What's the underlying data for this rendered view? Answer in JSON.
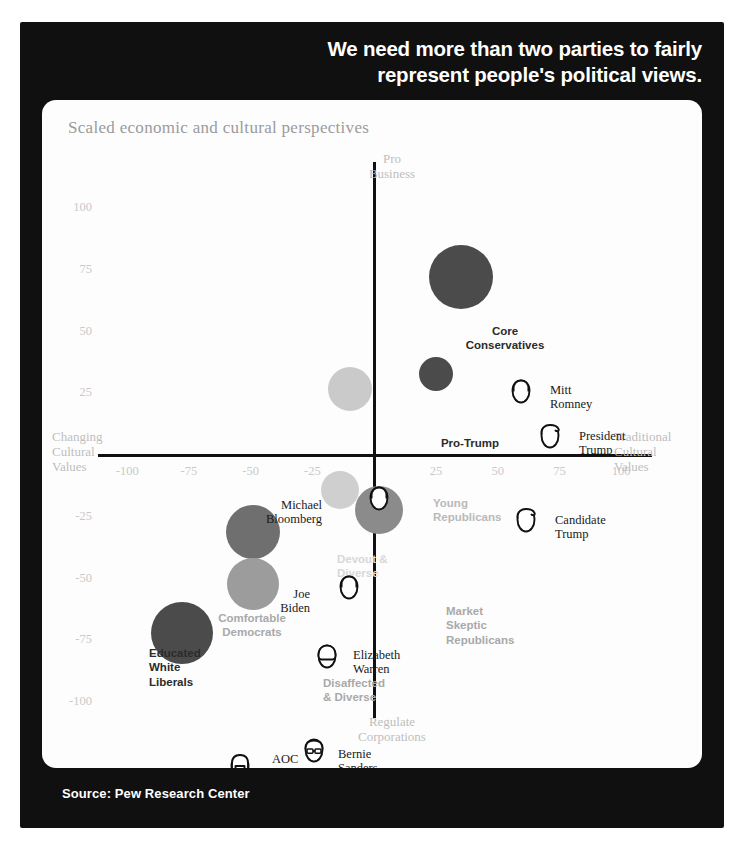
{
  "headline": "We need more than two parties to fairly represent people's political views.",
  "source": "Source: Pew Research Center",
  "chart_data": {
    "type": "scatter",
    "title": "We need more than two parties to fairly represent people's political views.",
    "subtitle": "Scaled economic and cultural perspectives",
    "xlabel_left": "Changing\nCultural\nValues",
    "xlabel_right": "Traditional\nCultural\nValues",
    "ylabel_top": "Pro\nBusiness",
    "ylabel_bottom": "Regulate\nCorporations",
    "xlim": [
      -110,
      110
    ],
    "ylim": [
      -110,
      110
    ],
    "grid": false,
    "legend": "none",
    "xticks": [
      -100,
      -75,
      -50,
      -25,
      25,
      50,
      75,
      100
    ],
    "yticks": [
      100,
      75,
      50,
      25,
      -25,
      -50,
      -75,
      -100
    ],
    "axis_captions": {
      "top": [
        "Pro",
        "Business"
      ],
      "bottom": [
        "Regulate",
        "Corporations"
      ],
      "left": [
        "Changing",
        "Cultural",
        "Values"
      ],
      "right": [
        "Traditional",
        "Cultural",
        "Values"
      ]
    },
    "bubbles": [
      {
        "name": "Core Conservatives",
        "x": 35,
        "y": 72,
        "r": 32,
        "color": "#4b4b4b",
        "label_style": "dark",
        "label_lines": [
          "Core",
          "Conservatives"
        ],
        "label_x": 408,
        "label_y": 224,
        "label_align": "center",
        "label_w": 110
      },
      {
        "name": "Pro-Trump",
        "x": 25,
        "y": 33,
        "r": 17,
        "color": "#4b4b4b",
        "label_style": "dark",
        "label_lines": [
          "Pro-Trump"
        ],
        "label_x": 383,
        "label_y": 336,
        "label_align": "center",
        "label_w": 90
      },
      {
        "name": "Young Republicans",
        "x": -10,
        "y": 27,
        "r": 22,
        "color": "#cacaca",
        "label_style": "soft",
        "label_lines": [
          "Young",
          "Republicans"
        ],
        "label_x": 391,
        "label_y": 396,
        "label_align": "left",
        "label_w": 100
      },
      {
        "name": "Devout & Diverse",
        "x": -14,
        "y": -14,
        "r": 19,
        "color": "#cfcfcf",
        "label_style": "soft2",
        "label_lines": [
          "Devout &",
          "Diverse"
        ],
        "label_x": 295,
        "label_y": 452,
        "label_align": "left",
        "label_w": 90
      },
      {
        "name": "Market Skeptic Republicans",
        "x": 2,
        "y": -22,
        "r": 24,
        "color": "#8b8b8b",
        "label_style": "mid",
        "label_lines": [
          "Market",
          "Skeptic",
          "Republicans"
        ],
        "label_x": 404,
        "label_y": 504,
        "label_align": "left",
        "label_w": 110
      },
      {
        "name": "Comfortable Democrats",
        "x": -49,
        "y": -31,
        "r": 27,
        "color": "#6f6f6f",
        "label_style": "mid",
        "label_lines": [
          "Comfortable",
          "Democrats"
        ],
        "label_x": 160,
        "label_y": 511,
        "label_align": "center",
        "label_w": 100
      },
      {
        "name": "Disaffected & Diverse",
        "x": -49,
        "y": -52,
        "r": 26,
        "color": "#9c9c9c",
        "label_style": "mid",
        "label_lines": [
          "Disaffected",
          "& Diverse"
        ],
        "label_x": 281,
        "label_y": 576,
        "label_align": "left",
        "label_w": 100
      },
      {
        "name": "Educated White Liberals",
        "x": -78,
        "y": -72,
        "r": 31,
        "color": "#4b4b4b",
        "label_style": "dark",
        "label_lines": [
          "Educated",
          "White",
          "Liberals"
        ],
        "label_x": 107,
        "label_y": 546,
        "label_align": "left",
        "label_w": 90
      }
    ],
    "people": [
      {
        "name": "Mitt Romney",
        "lines": [
          "Mitt",
          "Romney"
        ],
        "face_x": 479,
        "face_y": 291,
        "label_x": 508,
        "label_y": 291,
        "hair": "side"
      },
      {
        "name": "President Trump",
        "lines": [
          "President",
          "Trump"
        ],
        "face_x": 508,
        "face_y": 336,
        "label_x": 537,
        "label_y": 337,
        "hair": "swoop"
      },
      {
        "name": "Candidate Trump",
        "lines": [
          "Candidate",
          "Trump"
        ],
        "face_x": 484,
        "face_y": 420,
        "label_x": 513,
        "label_y": 421,
        "hair": "swoop"
      },
      {
        "name": "Michael Bloomberg",
        "lines": [
          "Michael",
          "Bloomberg"
        ],
        "face_x": 337,
        "face_y": 398,
        "label_x": 280,
        "label_y": 406,
        "hair": "side",
        "label_align": "right"
      },
      {
        "name": "Joe Biden",
        "lines": [
          "Joe",
          "Biden"
        ],
        "face_x": 307,
        "face_y": 487,
        "label_x": 268,
        "label_y": 495,
        "hair": "side",
        "label_align": "right"
      },
      {
        "name": "Elizabeth Warren",
        "lines": [
          "Elizabeth",
          "Warren"
        ],
        "face_x": 285,
        "face_y": 556,
        "label_x": 311,
        "label_y": 556,
        "hair": "bob"
      },
      {
        "name": "AOC",
        "lines": [
          "AOC"
        ],
        "face_x": 198,
        "face_y": 666,
        "label_x": 230,
        "label_y": 660,
        "hair": "long"
      },
      {
        "name": "Bernie Sanders",
        "lines": [
          "Bernie",
          "Sanders"
        ],
        "face_x": 272,
        "face_y": 650,
        "label_x": 296,
        "label_y": 655,
        "hair": "bald"
      }
    ]
  }
}
